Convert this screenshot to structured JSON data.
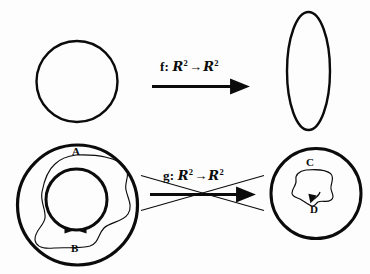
{
  "figure": {
    "background_color": "#fdfdfd",
    "stroke_color": "#0b0b0b",
    "width": 370,
    "height": 274
  },
  "rows": {
    "top": {
      "name": "f-mapping-row",
      "source_shape_name": "circle",
      "target_shape_name": "ellipse",
      "arrow_name": "f-arrow",
      "crossed_out": false,
      "label": {
        "function": "f",
        "colon": ":",
        "domain": "R",
        "domain_exponent": "2",
        "arrow": "→",
        "codomain": "R",
        "codomain_exponent": "2",
        "full_text": "f: R2 -> R2"
      }
    },
    "bottom": {
      "name": "g-mapping-row",
      "source_shape_name": "annulus-with-loop",
      "target_shape_name": "disk-with-loop",
      "arrow_name": "g-arrow",
      "crossed_out": true,
      "cross_name": "invalid-cross",
      "label": {
        "function": "g",
        "colon": ":",
        "domain": "R",
        "domain_exponent": "2",
        "arrow": "→",
        "codomain": "R",
        "codomain_exponent": "2",
        "full_text": "g: R2 -> R2"
      }
    }
  },
  "region_labels": [
    {
      "id": "A",
      "text": "A",
      "name": "curve-label-a",
      "description": "outer irregular loop in annulus"
    },
    {
      "id": "B",
      "text": "B",
      "name": "curve-label-b",
      "description": "inner circle of annulus with opposing arrowheads"
    },
    {
      "id": "C",
      "text": "C",
      "name": "curve-label-c",
      "description": "irregular loop inside right disk"
    },
    {
      "id": "D",
      "text": "D",
      "name": "curve-label-d",
      "description": "arrowhead target point inside right disk"
    }
  ],
  "colors": {
    "ink": "#0b0b0b",
    "paper": "#fdfdfd"
  }
}
